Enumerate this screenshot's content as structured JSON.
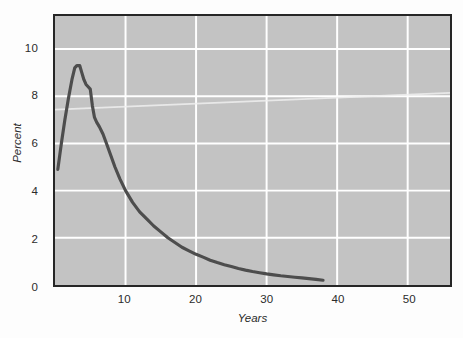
{
  "figure": {
    "background_color": "#fdfdfd",
    "plot_background_color": "#c3c3c3",
    "frame_color": "#262626",
    "gridline_color": "#ffffff",
    "curve_color": "#4d4d4d"
  },
  "axes": {
    "ylabel": "Percent",
    "xlabel": "Years",
    "y_ticks": [
      {
        "value": 0,
        "label": "0"
      },
      {
        "value": 2,
        "label": "2"
      },
      {
        "value": 4,
        "label": "4"
      },
      {
        "value": 6,
        "label": "6"
      },
      {
        "value": 8,
        "label": "8"
      },
      {
        "value": 10,
        "label": "10"
      }
    ],
    "x_ticks": [
      {
        "value": 10,
        "label": "10"
      },
      {
        "value": 20,
        "label": "20"
      },
      {
        "value": 30,
        "label": "30"
      },
      {
        "value": 40,
        "label": "40"
      },
      {
        "value": 50,
        "label": "50"
      }
    ]
  },
  "chart_data": {
    "type": "line",
    "title": "",
    "subtitle": "",
    "xlabel": "Years",
    "ylabel": "Percent",
    "xlim": [
      0,
      56
    ],
    "ylim": [
      0,
      11.4
    ],
    "grid": true,
    "legend": null,
    "x_tick_labels": [
      "10",
      "20",
      "30",
      "40",
      "50"
    ],
    "y_tick_labels": [
      "0",
      "2",
      "4",
      "6",
      "8",
      "10"
    ],
    "series": [
      {
        "name": "Percent by year",
        "color": "#4d4d4d",
        "line_width": 3,
        "x": [
          0.4,
          0.9,
          1.4,
          1.9,
          2.4,
          2.8,
          3.1,
          3.5,
          3.8,
          4.1,
          4.4,
          4.7,
          5.0,
          5.3,
          5.6,
          5.9,
          6.3,
          6.8,
          7.3,
          7.9,
          8.5,
          9.2,
          10.0,
          11.0,
          12.0,
          13.0,
          14.0,
          15.0,
          16.0,
          17.0,
          18.0,
          19.0,
          20.0,
          21.0,
          22.0,
          23.0,
          24.0,
          25.0,
          26.0,
          27.0,
          28.0,
          29.0,
          30.0,
          31.0,
          32.0,
          33.0,
          34.0,
          35.0,
          36.0,
          37.0,
          38.0
        ],
        "y": [
          4.9,
          6.0,
          7.0,
          7.9,
          8.7,
          9.2,
          9.3,
          9.3,
          9.0,
          8.7,
          8.5,
          8.4,
          8.3,
          7.6,
          7.1,
          6.9,
          6.7,
          6.4,
          6.0,
          5.5,
          5.0,
          4.5,
          4.0,
          3.5,
          3.1,
          2.8,
          2.5,
          2.25,
          2.0,
          1.8,
          1.6,
          1.45,
          1.3,
          1.18,
          1.05,
          0.95,
          0.86,
          0.78,
          0.7,
          0.63,
          0.57,
          0.52,
          0.47,
          0.43,
          0.39,
          0.36,
          0.33,
          0.3,
          0.27,
          0.24,
          0.2
        ]
      }
    ]
  }
}
